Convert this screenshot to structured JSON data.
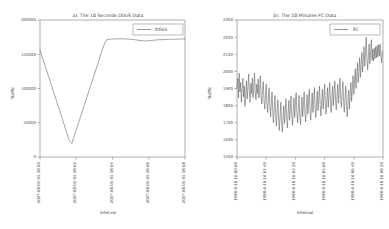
{
  "figure": {
    "panels": [
      "a",
      "b"
    ]
  },
  "chart_data": [
    {
      "type": "line",
      "panel": "a",
      "title": "a). The 10 Seconds DDoS Data",
      "xlabel": "Interval",
      "ylabel": "Traffic",
      "legend": [
        "DDoS"
      ],
      "legend_position": "top-right",
      "grid": false,
      "ylim": [
        0,
        200000
      ],
      "yticks": [
        0,
        50000,
        100000,
        150000,
        200000
      ],
      "ytick_labels": [
        "0",
        "50000",
        "100000",
        "150000",
        "200000"
      ],
      "xtick_labels": [
        "2007-08-05 05:38:00",
        "2007-08-05 05:38:02",
        "2007-08-05 05:38:04",
        "2007-08-05 05:38:06",
        "2007-08-05 05:38:08"
      ],
      "xtick_positions": [
        0,
        25,
        50,
        75,
        100
      ],
      "series": [
        {
          "name": "DDoS",
          "color": "#5a5a5a",
          "x": [
            0,
            2,
            4,
            6,
            8,
            10,
            12,
            14,
            16,
            18,
            20,
            22,
            24,
            26,
            28,
            30,
            32,
            34,
            36,
            38,
            40,
            42,
            44,
            46,
            48,
            50,
            52,
            54,
            56,
            58,
            60,
            62,
            64,
            66,
            68,
            70,
            72,
            74,
            76,
            78,
            80,
            82,
            84,
            86,
            88,
            90,
            92,
            94,
            96,
            98,
            100
          ],
          "values": [
            156000,
            143000,
            130000,
            117000,
            104000,
            91000,
            78000,
            65000,
            52000,
            38000,
            24000,
            20000,
            33000,
            46000,
            59000,
            72000,
            85000,
            98000,
            111000,
            124000,
            137000,
            150000,
            163000,
            171500,
            172000,
            172200,
            172400,
            172500,
            172600,
            172400,
            172200,
            172000,
            171600,
            171000,
            170300,
            169800,
            169500,
            169600,
            170000,
            170400,
            170800,
            171100,
            171300,
            171500,
            171700,
            171800,
            171900,
            172000,
            172100,
            172200,
            172300
          ]
        }
      ]
    },
    {
      "type": "line",
      "panel": "b",
      "title": "b). The 10 Minutes FC Data",
      "xlabel": "Interval",
      "ylabel": "Traffic",
      "legend": [
        "FC"
      ],
      "legend_position": "top-right",
      "grid": false,
      "ylim": [
        1500,
        2300
      ],
      "yticks": [
        1500,
        1600,
        1700,
        1800,
        1900,
        2000,
        2100,
        2200,
        2300
      ],
      "ytick_labels": [
        "1500",
        "1600",
        "1700",
        "1800",
        "1900",
        "2000",
        "2100",
        "2200",
        "2300"
      ],
      "xtick_labels": [
        "1998-6-10 16:00:00",
        "1998-6-10 16:01:40",
        "1998-6-10 16:03:20",
        "1998-6-10 16:05:00",
        "1998-6-10 16:06:40",
        "1998-6-10 16:08:20"
      ],
      "xtick_positions": [
        0,
        20,
        40,
        60,
        80,
        100
      ],
      "series": [
        {
          "name": "FC",
          "color": "#5a5a5a",
          "x": [
            0,
            0.5,
            1,
            1.5,
            2,
            2.5,
            3,
            3.5,
            4,
            4.5,
            5,
            5.5,
            6,
            6.5,
            7,
            7.5,
            8,
            8.5,
            9,
            9.5,
            10,
            10.5,
            11,
            11.5,
            12,
            12.5,
            13,
            13.5,
            14,
            14.5,
            15,
            15.5,
            16,
            16.5,
            17,
            17.5,
            18,
            18.5,
            19,
            19.5,
            20,
            20.5,
            21,
            21.5,
            22,
            22.5,
            23,
            23.5,
            24,
            24.5,
            25,
            25.5,
            26,
            26.5,
            27,
            27.5,
            28,
            28.5,
            29,
            29.5,
            30,
            30.5,
            31,
            31.5,
            32,
            32.5,
            33,
            33.5,
            34,
            34.5,
            35,
            35.5,
            36,
            36.5,
            37,
            37.5,
            38,
            38.5,
            39,
            39.5,
            40,
            40.5,
            41,
            41.5,
            42,
            42.5,
            43,
            43.5,
            44,
            44.5,
            45,
            45.5,
            46,
            46.5,
            47,
            47.5,
            48,
            48.5,
            49,
            49.5,
            50,
            50.5,
            51,
            51.5,
            52,
            52.5,
            53,
            53.5,
            54,
            54.5,
            55,
            55.5,
            56,
            56.5,
            57,
            57.5,
            58,
            58.5,
            59,
            59.5,
            60,
            60.5,
            61,
            61.5,
            62,
            62.5,
            63,
            63.5,
            64,
            64.5,
            65,
            65.5,
            66,
            66.5,
            67,
            67.5,
            68,
            68.5,
            69,
            69.5,
            70,
            70.5,
            71,
            71.5,
            72,
            72.5,
            73,
            73.5,
            74,
            74.5,
            75,
            75.5,
            76,
            76.5,
            77,
            77.5,
            78,
            78.5,
            79,
            79.5,
            80,
            80.5,
            81,
            81.5,
            82,
            82.5,
            83,
            83.5,
            84,
            84.5,
            85,
            85.5,
            86,
            86.5,
            87,
            87.5,
            88,
            88.5,
            89,
            89.5,
            90,
            90.5,
            91,
            91.5,
            92,
            92.5,
            93,
            93.5,
            94,
            94.5,
            95,
            95.5,
            96,
            96.5,
            97,
            97.5,
            98,
            98.5,
            99,
            99.5,
            100
          ],
          "values": [
            1905,
            1960,
            1845,
            1990,
            1880,
            1935,
            1820,
            1900,
            1960,
            1850,
            1915,
            1795,
            1870,
            1945,
            1840,
            1905,
            1985,
            1875,
            1820,
            1930,
            1870,
            1960,
            1845,
            1905,
            1990,
            1880,
            1835,
            1925,
            1870,
            1955,
            1845,
            1900,
            1975,
            1860,
            1810,
            1890,
            1940,
            1830,
            1780,
            1860,
            1925,
            1815,
            1760,
            1845,
            1905,
            1800,
            1735,
            1820,
            1880,
            1770,
            1700,
            1785,
            1860,
            1745,
            1680,
            1760,
            1835,
            1720,
            1655,
            1740,
            1820,
            1710,
            1645,
            1730,
            1800,
            1695,
            1760,
            1840,
            1725,
            1670,
            1755,
            1830,
            1715,
            1780,
            1855,
            1740,
            1685,
            1770,
            1845,
            1730,
            1800,
            1875,
            1760,
            1700,
            1790,
            1860,
            1745,
            1690,
            1775,
            1850,
            1735,
            1805,
            1880,
            1765,
            1705,
            1790,
            1865,
            1750,
            1820,
            1895,
            1780,
            1715,
            1800,
            1875,
            1760,
            1830,
            1905,
            1790,
            1730,
            1815,
            1885,
            1770,
            1840,
            1915,
            1800,
            1740,
            1825,
            1895,
            1780,
            1850,
            1925,
            1810,
            1750,
            1835,
            1905,
            1790,
            1860,
            1935,
            1820,
            1760,
            1845,
            1915,
            1800,
            1870,
            1945,
            1830,
            1775,
            1855,
            1925,
            1815,
            1885,
            1960,
            1845,
            1790,
            1870,
            1940,
            1825,
            1760,
            1845,
            1915,
            1800,
            1735,
            1820,
            1890,
            1780,
            1855,
            1935,
            1825,
            1900,
            1975,
            1865,
            1940,
            2015,
            1900,
            1975,
            2050,
            1935,
            2000,
            2080,
            1965,
            2035,
            2110,
            1995,
            2065,
            2145,
            2030,
            2100,
            2200,
            2070,
            2010,
            2090,
            2160,
            2045,
            2110,
            2185,
            2065,
            2130,
            2060,
            2135,
            2075,
            2145,
            2080,
            2150,
            2085,
            2155,
            2090,
            2160,
            2095,
            2050,
            2120
          ]
        }
      ]
    }
  ]
}
